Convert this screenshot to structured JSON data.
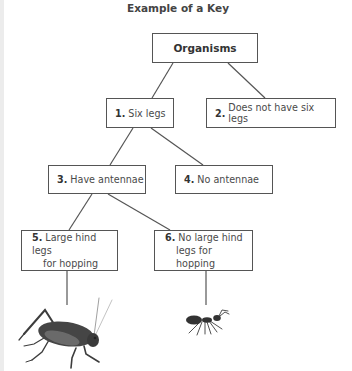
{
  "title": "Example of a Key",
  "nodes": {
    "root": {
      "label": "Organisms"
    },
    "n1": {
      "number": "1.",
      "text": "Six legs"
    },
    "n2": {
      "number": "2.",
      "text": "Does not have six legs"
    },
    "n3": {
      "number": "3.",
      "text": "Have antennae"
    },
    "n4": {
      "number": "4.",
      "text": "No antennae"
    },
    "n5": {
      "number": "5.",
      "line1": "Large hind legs",
      "line2": "for hopping"
    },
    "n6": {
      "number": "6.",
      "line1": "No large hind",
      "line2": "legs for hopping"
    }
  },
  "edges": [
    [
      "root",
      "n1"
    ],
    [
      "root",
      "n2"
    ],
    [
      "n1",
      "n3"
    ],
    [
      "n1",
      "n4"
    ],
    [
      "n3",
      "n5"
    ],
    [
      "n3",
      "n6"
    ],
    [
      "n5",
      "grasshopper"
    ],
    [
      "n6",
      "ant"
    ]
  ],
  "images": {
    "grasshopper": "grasshopper-illustration",
    "ant": "ant-illustration"
  },
  "colors": {
    "line": "#555555",
    "text": "#4a4a4a",
    "insect": "#3d3d3d"
  }
}
